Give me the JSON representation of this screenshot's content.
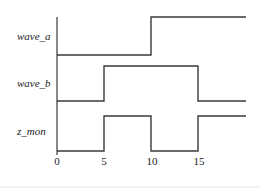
{
  "diagram": {
    "type": "timing",
    "time_axis": {
      "ticks": [
        {
          "value": 0,
          "label": "0"
        },
        {
          "value": 5,
          "label": "5"
        },
        {
          "value": 10,
          "label": "10"
        },
        {
          "value": 15,
          "label": "15"
        }
      ],
      "range": [
        0,
        20
      ]
    },
    "signals": [
      {
        "name": "wave_a",
        "label": "wave_a",
        "transitions": [
          {
            "t": 0,
            "level": 0
          },
          {
            "t": 10,
            "level": 1
          }
        ]
      },
      {
        "name": "wave_b",
        "label": "wave_b",
        "transitions": [
          {
            "t": 0,
            "level": 0
          },
          {
            "t": 5,
            "level": 1
          },
          {
            "t": 15,
            "level": 0
          }
        ]
      },
      {
        "name": "z_mon",
        "label": "z_mon",
        "transitions": [
          {
            "t": 0,
            "level": 0
          },
          {
            "t": 5,
            "level": 1
          },
          {
            "t": 10,
            "level": 0
          },
          {
            "t": 15,
            "level": 1
          }
        ]
      }
    ],
    "colors": {
      "line": "#3a3a3a",
      "text": "#1a1a1a",
      "background": "#ffffff"
    }
  }
}
